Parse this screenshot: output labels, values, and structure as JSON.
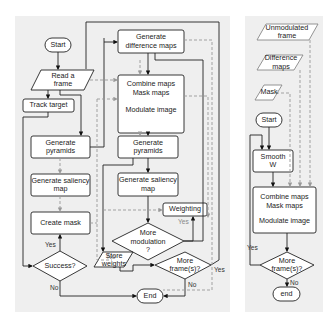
{
  "left": {
    "start": "Start",
    "read_frame": "Read a frame",
    "track_target": "Track target",
    "gen_pyramids": "Generate pyramids",
    "gen_saliency": "Generate saliency map",
    "create_mask": "Create mask",
    "success": "Success?",
    "yes1": "Yes",
    "no1": "No",
    "gen_diff": "Generate difference maps",
    "combine1": "Combine maps",
    "combine2": "Mask maps",
    "modulate": "Modulate image",
    "gen_pyramids2": "Generate pyramids",
    "gen_saliency2": "Generate saliency map",
    "weighting": "Weighting",
    "yes_weight": "Yes",
    "more_mod": "More modulation ?",
    "no_mod": "No",
    "store": "Store weights",
    "more_frames": "More frame(s)?",
    "yes_frames": "Yes",
    "no_frames": "No",
    "end": "End"
  },
  "right": {
    "unmod": "Unmodulated frame",
    "diff": "Difference maps",
    "mask": "Mask",
    "start": "Start",
    "smooth": "Smooth W",
    "combine1": "Combine maps",
    "combine2": "Mask maps",
    "modulate": "Modulate image",
    "yes": "Yes",
    "more_frames": "More frame(s)?",
    "no": "No",
    "end": "end"
  }
}
